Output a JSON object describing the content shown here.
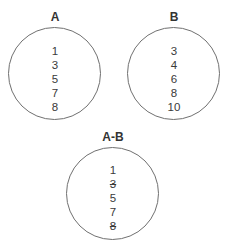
{
  "sets": [
    {
      "id": "A",
      "label": "A",
      "members": [
        {
          "value": "1",
          "struck": false
        },
        {
          "value": "3",
          "struck": false
        },
        {
          "value": "5",
          "struck": false
        },
        {
          "value": "7",
          "struck": false
        },
        {
          "value": "8",
          "struck": false
        }
      ]
    },
    {
      "id": "B",
      "label": "B",
      "members": [
        {
          "value": "3",
          "struck": false
        },
        {
          "value": "4",
          "struck": false
        },
        {
          "value": "6",
          "struck": false
        },
        {
          "value": "8",
          "struck": false
        },
        {
          "value": "10",
          "struck": false
        }
      ]
    },
    {
      "id": "A-B",
      "label": "A-B",
      "members": [
        {
          "value": "1",
          "struck": false
        },
        {
          "value": "3",
          "struck": true
        },
        {
          "value": "5",
          "struck": false
        },
        {
          "value": "7",
          "struck": false
        },
        {
          "value": "8",
          "struck": true
        }
      ]
    }
  ],
  "colors": {
    "stroke": "#707070",
    "text": "#333333"
  }
}
